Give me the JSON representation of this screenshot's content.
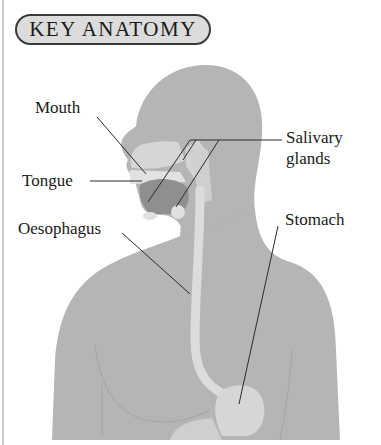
{
  "title": "KEY ANATOMY",
  "figure": {
    "colors": {
      "body": "#b5b5b5",
      "inner": "#d8d8d8",
      "tongue": "#8f8f8f",
      "leader_line": "#2a2a2a",
      "capsule_fill": "#dcdcdc",
      "capsule_border": "#3a3a3a"
    }
  },
  "labels": {
    "mouth": "Mouth",
    "tongue": "Tongue",
    "salivary_line1": "Salivary",
    "salivary_line2": "glands",
    "oesophagus": "Oesophagus",
    "stomach": "Stomach"
  }
}
